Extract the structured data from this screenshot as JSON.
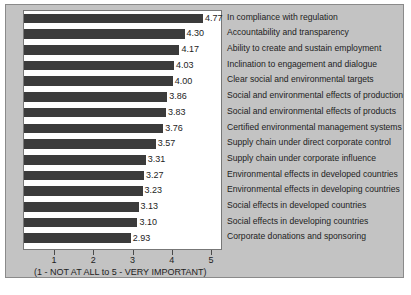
{
  "chart_data": {
    "type": "bar",
    "orientation": "horizontal",
    "title": "",
    "subtitle": "",
    "xlabel": "(1 - NOT AT ALL to 5 - VERY IMPORTANT)",
    "ylabel": "",
    "xlim": [
      0,
      5
    ],
    "xticks": [
      1,
      2,
      3,
      4,
      5
    ],
    "xtick_labels": [
      "1",
      "2",
      "3",
      "4",
      "5"
    ],
    "grid": false,
    "legend": null,
    "bar_color": "#3b3b3b",
    "plot_background": "#ffffff",
    "figure_background": "#c3c3c3",
    "categories": [
      "In compliance with regulation",
      "Accountability and transparency",
      "Ability to create and sustain employment",
      "Inclination to engagement and dialogue",
      "Clear social and environmental targets",
      "Social and environmental effects of production",
      "Social and environmental effects of products",
      "Certified environmental management systems",
      "Supply chain under direct corporate control",
      "Supply chain under corporate influence",
      "Environmental effects in developed countries",
      "Environmental effects in developing countries",
      "Social effects in developed countries",
      "Social effects in developing countries",
      "Corporate donations and sponsoring"
    ],
    "values": [
      4.77,
      4.3,
      4.17,
      4.03,
      4.0,
      3.86,
      3.83,
      3.76,
      3.57,
      3.31,
      3.27,
      3.23,
      3.13,
      3.1,
      2.93
    ],
    "value_labels": [
      "4.77",
      "4.30",
      "4.17",
      "4.03",
      "4.00",
      "3.86",
      "3.83",
      "3.76",
      "3.57",
      "3.31",
      "3.27",
      "3.23",
      "3.13",
      "3.10",
      "2.93"
    ]
  }
}
